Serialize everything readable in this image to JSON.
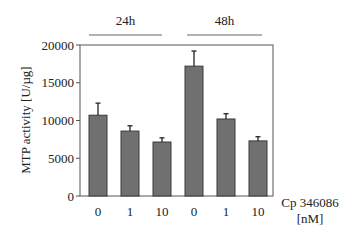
{
  "chart_data": {
    "type": "bar",
    "title": "",
    "xlabel": "Cp 346086 [nM]",
    "xlabel_lines": [
      "Cp 346086",
      "[nM]"
    ],
    "ylabel": "MTP activity [U/µg]",
    "ylim": [
      0,
      20000
    ],
    "yticks": [
      0,
      5000,
      10000,
      15000,
      20000
    ],
    "ytick_labels": [
      "0",
      "5000",
      "10000",
      "15000",
      "20000"
    ],
    "grid": false,
    "groups": [
      {
        "label": "24h",
        "categories": [
          "0",
          "1",
          "10"
        ]
      },
      {
        "label": "48h",
        "categories": [
          "0",
          "1",
          "10"
        ]
      }
    ],
    "categories": [
      "0",
      "1",
      "10",
      "0",
      "1",
      "10"
    ],
    "values": [
      10700,
      8600,
      7150,
      17200,
      10200,
      7300
    ],
    "error_upper": [
      1600,
      700,
      550,
      2000,
      700,
      550
    ],
    "bar_color": "#707070",
    "edge_color": "#3a3a3a"
  }
}
